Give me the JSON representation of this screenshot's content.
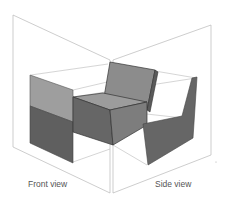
{
  "figure": {
    "labels": {
      "front": "Front view",
      "side": "Side view"
    },
    "colors": {
      "frame_line": "#b0b0b0",
      "light_face": "#9a9a9a",
      "mid_face": "#7a7a7a",
      "dark_face": "#5e5e5e",
      "edge": "#3a3a3a"
    }
  }
}
